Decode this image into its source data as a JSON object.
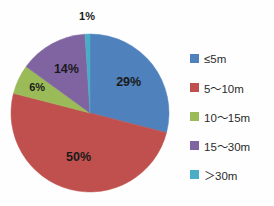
{
  "chart_data": {
    "type": "pie",
    "title": "",
    "subtitle": "",
    "xlabel": "",
    "ylabel": "",
    "legend_position": "right",
    "grid": false,
    "start_angle_deg": 0,
    "direction": "clockwise",
    "categories": [
      "≤5m",
      "5～10m",
      "10～15m",
      "15～30m",
      "＞30m"
    ],
    "values": [
      29,
      50,
      6,
      14,
      1
    ],
    "unit": "%",
    "data_labels": [
      "29%",
      "50%",
      "6%",
      "14%",
      "1%"
    ],
    "colors": [
      "#4F81BD",
      "#C0504D",
      "#9BBB59",
      "#8064A2",
      "#4BACC6"
    ],
    "slices": [
      {
        "label": "≤5m",
        "value": 29,
        "data_label": "29%",
        "color": "#4F81BD"
      },
      {
        "label": "5～10m",
        "value": 50,
        "data_label": "50%",
        "color": "#C0504D"
      },
      {
        "label": "10～15m",
        "value": 6,
        "data_label": "6%",
        "color": "#9BBB59"
      },
      {
        "label": "15～30m",
        "value": 14,
        "data_label": "14%",
        "color": "#8064A2"
      },
      {
        "label": "＞30m",
        "value": 1,
        "data_label": "1%",
        "color": "#4BACC6"
      }
    ]
  },
  "legend": {
    "items": [
      {
        "label": "≤5m",
        "color": "#4F81BD"
      },
      {
        "label": "5～10m",
        "color": "#C0504D"
      },
      {
        "label": "10～15m",
        "color": "#9BBB59"
      },
      {
        "label": "15～30m",
        "color": "#8064A2"
      },
      {
        "label": "＞30m",
        "color": "#4BACC6"
      }
    ]
  },
  "canvas": {
    "background": "#FEFEFE",
    "label_text_color": "#1A1A1A"
  }
}
